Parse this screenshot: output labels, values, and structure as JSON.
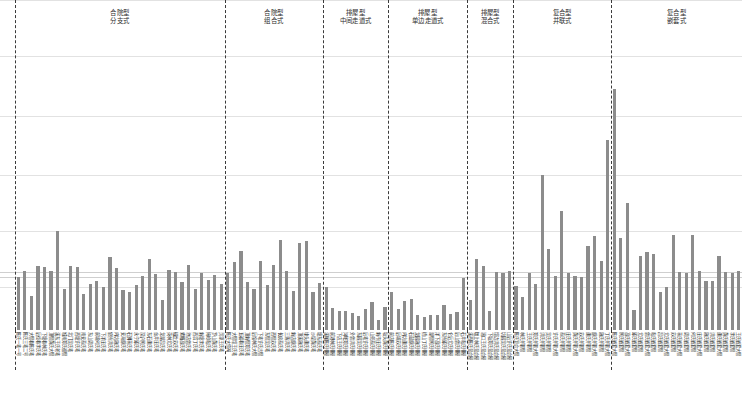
{
  "chart_data": {
    "type": "bar",
    "title": "",
    "subtitle": "",
    "xlabel": "",
    "ylabel": "",
    "ylim": [
      0,
      100
    ],
    "grid": true,
    "legend_position": "none",
    "bar_color": "#8c8c8c",
    "gridline_values": [
      100,
      83,
      65,
      47,
      30,
      13
    ],
    "reference_lines": [
      17.5,
      16.2
    ],
    "groups": [
      {
        "id": "group-1",
        "line1": "合院型",
        "line2": "分支式",
        "categories": [
          "陈氏一宅一号",
          "陈氏三宅二号",
          "大厝巷陈氏宅",
          "后街巷李氏宅",
          "下塘巷林氏宅",
          "顶厝黄氏大厝",
          "溪东王氏老宅",
          "城南郑氏祖厝",
          "北门吴氏宅",
          "西塘许氏宅",
          "南安蔡氏宅",
          "东山周氏宅",
          "前埔何氏宅",
          "下洋庄氏宅",
          "官桥洪氏宅",
          "内坑施氏宅",
          "安海颜氏宅",
          "石狮蒋氏宅",
          "永宁邱氏宅",
          "深沪柯氏宅",
          "东石谢氏宅",
          "金井庄氏宅",
          "龙湖吕氏宅",
          "英林尤氏宅",
          "磁灶苏氏宅",
          "紫帽高氏宅",
          "池店曾氏宅",
          "西滨丁氏宅",
          "新塘李氏宅",
          "梅岭粘氏宅",
          "罗山黄氏宅",
          "灵源王氏宅"
        ],
        "values": [
          16.0,
          17.8,
          10.3,
          19.5,
          19.0,
          18.0,
          30.0,
          12.5,
          19.3,
          19.2,
          11.0,
          13.8,
          14.8,
          13.0,
          22.0,
          18.8,
          12.0,
          11.6,
          13.5,
          16.3,
          21.5,
          17.0,
          9.2,
          18.2,
          17.5,
          14.5,
          19.6,
          12.4,
          17.4,
          15.3,
          16.8,
          13.9
        ]
      },
      {
        "id": "group-2",
        "line1": "合院型",
        "line2": "组合式",
        "categories": [
          "陈氏大宗祠",
          "大厝埕王氏宅",
          "五福巷庄氏宅",
          "顶新厝郑氏宅",
          "后垵林氏大厝",
          "下宅许氏古厝",
          "东厝吴氏宅",
          "西厝苏氏宅",
          "长房蔡氏宅",
          "三落洪氏宅",
          "新店颜氏宅",
          "顶溪施氏宅",
          "埭头谢氏宅",
          "沙堤黄氏宅",
          "塘东蔡氏宅"
        ],
        "values": [
          17.2,
          20.7,
          24.0,
          14.6,
          12.5,
          21.0,
          13.5,
          19.8,
          27.2,
          17.9,
          11.8,
          26.5,
          27.0,
          11.6,
          14.2
        ]
      },
      {
        "id": "group-3",
        "line1": "排屋型",
        "line2": "中间走道式",
        "categories": [
          "溪尾陈氏排屋",
          "前港林氏排屋",
          "下店王氏排屋",
          "沟墘郑氏排屋",
          "外曾洪氏排屋",
          "东园吴氏排屋",
          "后宅许氏排屋",
          "山兜蔡氏排屋",
          "新市庄氏排屋",
          "坂头黄氏排屋"
        ],
        "values": [
          13.0,
          6.7,
          5.9,
          5.8,
          5.2,
          4.2,
          6.3,
          8.5,
          3.0,
          7.0
        ]
      },
      {
        "id": "group-4",
        "line1": "排屋型",
        "line2": "单边走道式",
        "categories": [
          "前店陈氏排屋",
          "后埔苏氏排屋",
          "内坑谢氏排屋",
          "石鼓颜氏排屋",
          "龙园施氏排屋",
          "梧山丁氏排屋",
          "湖厝柯氏排屋",
          "洋下高氏排屋",
          "东桥邱氏排屋",
          "仑后尤氏排屋",
          "后山曾氏排屋",
          "石井粘氏排屋"
        ],
        "values": [
          11.5,
          6.5,
          8.9,
          9.5,
          4.7,
          4.0,
          4.5,
          4.4,
          7.5,
          4.8,
          5.5,
          15.8
        ]
      },
      {
        "id": "group-5",
        "line1": "排屋型",
        "line2": "混合式",
        "categories": [
          "溪西陈氏混合屋",
          "墩上林氏混合屋",
          "涵口王氏混合屋",
          "下坂郑氏混合屋",
          "埕边洪氏混合屋",
          "坑园吴氏混合屋",
          "山后许氏混合屋"
        ],
        "values": [
          9.0,
          21.4,
          19.5,
          5.9,
          17.6,
          17.3,
          17.9
        ]
      },
      {
        "id": "group-6",
        "line1": "复合型",
        "line2": "并联式",
        "categories": [
          "陈氏复合大厝",
          "林氏并联厝",
          "王氏并联厝",
          "郑氏并联大厝",
          "洪氏并联厝",
          "吴氏并联厝",
          "许氏并联大厝",
          "蔡氏并联厝",
          "庄氏并联厝",
          "黄氏并联大厝",
          "苏氏并联厝",
          "谢氏并联厝",
          "颜氏并联大厝",
          "施氏并联厝",
          "丁氏并联大厝"
        ],
        "values": [
          13.2,
          10.0,
          17.3,
          14.0,
          47.0,
          24.5,
          16.3,
          36.0,
          17.2,
          16.5,
          16.0,
          25.5,
          28.5,
          21.0,
          57.5
        ]
      },
      {
        "id": "group-7",
        "line1": "复合型",
        "line2": "嵌套式",
        "categories": [
          "陈氏嵌套大厝",
          "柯氏嵌套厝",
          "高氏嵌套大厝",
          "邱氏嵌套厝",
          "尤氏嵌套厝",
          "曾氏嵌套大厝",
          "粘氏嵌套厝",
          "吕氏嵌套厝",
          "尤氏嵌套大厝",
          "苏氏嵌套厝",
          "蒋氏嵌套大厝",
          "周氏嵌套厝",
          "何氏嵌套厝",
          "庄氏嵌套大厝",
          "施氏嵌套厝",
          "洪氏嵌套厝",
          "谢氏嵌套大厝",
          "黄氏嵌套厝",
          "李氏嵌套厝",
          "王氏嵌套大厝"
        ],
        "values": [
          73.0,
          28.0,
          38.5,
          6.0,
          22.5,
          23.5,
          23.0,
          11.5,
          13.0,
          28.7,
          17.5,
          17.3,
          28.8,
          17.8,
          14.8,
          15.0,
          22.3,
          17.6,
          17.4,
          18.0
        ]
      }
    ]
  }
}
